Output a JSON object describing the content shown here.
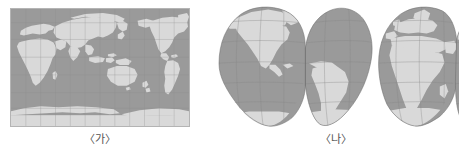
{
  "page": {
    "background_color": "#ffffff",
    "width": 465,
    "height": 160
  },
  "figures": [
    {
      "id": "ga",
      "caption": "〈가〉",
      "projection_name": "Mercator (rectangular world map)",
      "centered_on": "Pacific Ocean / 150°E",
      "shape": "rectangle",
      "border_color": "#b4b4b4",
      "ocean_color": "#9a9a9a",
      "land_color": "#d9d9d9",
      "graticule_color": "#8d8d8d",
      "graticule": {
        "meridian_interval_deg": 30,
        "parallel_interval_deg": 30,
        "visible": true
      }
    },
    {
      "id": "na",
      "caption": "〈나〉",
      "projection_name": "Goode homolosine (interrupted)",
      "lobes": 3,
      "lobe_labels": [
        "Americas",
        "Europe-Africa",
        "Asia-Oceania"
      ],
      "shape": "interrupted-lobes",
      "outline_color": "#6e6e6e",
      "ocean_color": "#9a9a9a",
      "land_color": "#d9d9d9",
      "graticule_color": "#868686",
      "graticule": {
        "meridian_interval_deg": 30,
        "parallel_interval_deg": 30,
        "visible": true
      }
    }
  ],
  "captions": {
    "left": "〈가〉",
    "right": "〈나〉"
  }
}
